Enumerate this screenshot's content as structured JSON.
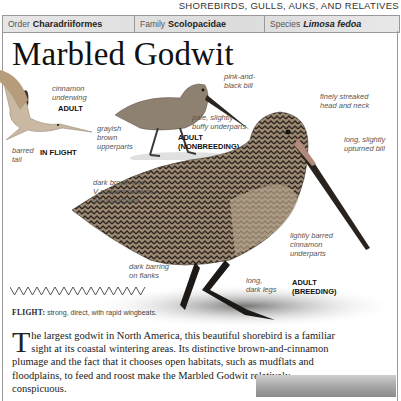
{
  "section_header": "SHOREBIRDS, GULLS, AUKS, AND RELATIVES",
  "taxonomy": [
    {
      "label": "Order",
      "value": "Charadriiformes",
      "italic": false
    },
    {
      "label": "Family",
      "value": "Scolopacidae",
      "italic": false
    },
    {
      "label": "Species",
      "value": "Limosa fedoa",
      "italic": true
    }
  ],
  "title": "Marbled Godwit",
  "illustrations": {
    "flight": {
      "caption_age": "ADULT",
      "caption_view": "IN FLIGHT",
      "labels": [
        "cinnamon underwing",
        "barred tail"
      ]
    },
    "nonbreeding": {
      "caption": "ADULT (NONBREEDING)",
      "labels": [
        "pink-and-black bill",
        "pale, slightly buffy underparts",
        "grayish brown upperparts"
      ]
    },
    "breeding": {
      "caption": "ADULT (BREEDING)",
      "labels": [
        "finely streaked head and neck",
        "long, slightly upturned bill",
        "dark brown and V-shaped patterns on upperparts",
        "dark barring on flanks",
        "lightly barred cinnamon underparts",
        "long, dark legs"
      ]
    }
  },
  "flight_pattern": {
    "label": "FLIGHT:",
    "text": "strong, direct, with rapid wingbeats."
  },
  "body": {
    "dropcap": "T",
    "text": "he largest godwit in North America, this beautiful shorebird is a familiar sight at its coastal wintering areas. Its distinctive brown-and-cinnamon plumage and the fact that it chooses open habitats, such as mudflats and floodplains, to feed and roost make the Marbled Godwit relatively conspicuous."
  }
}
